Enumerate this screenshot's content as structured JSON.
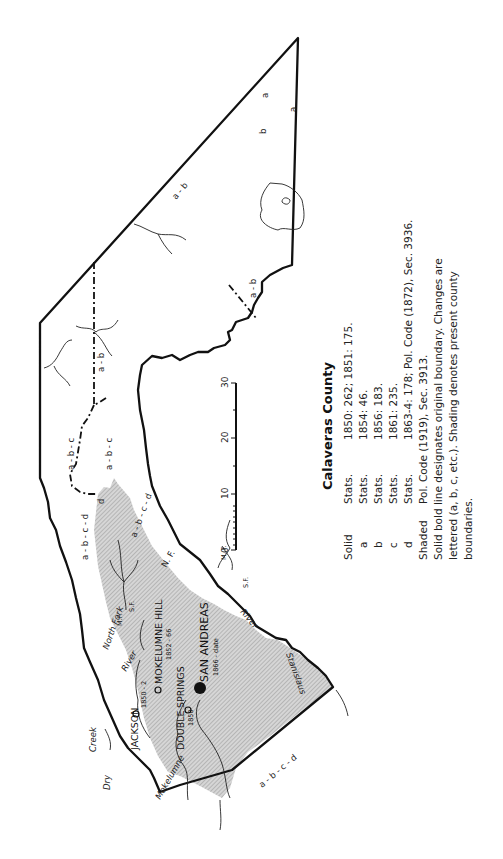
{
  "map": {
    "title": "Calaveras County",
    "colors": {
      "line": "#111111",
      "shade": "#c8c8c8",
      "background": "#ffffff"
    },
    "legend": [
      {
        "key": "Solid",
        "source": "Stats.",
        "text": "1850: 262; 1851: 175."
      },
      {
        "key": "a",
        "source": "Stats.",
        "text": "1854: 46."
      },
      {
        "key": "b",
        "source": "Stats.",
        "text": "1856: 183."
      },
      {
        "key": "c",
        "source": "Stats.",
        "text": "1861: 235."
      },
      {
        "key": "d",
        "source": "Stats.",
        "text": "1863-4: 178; Pol. Code (1872), Sec. 3936."
      },
      {
        "key": "Shaded",
        "source": "Pol. Code (1919), Sec. 3913.",
        "text": ""
      }
    ],
    "notes": [
      "Solid bold line designates original boundary. Changes are",
      "lettered (a, b, c, etc.). Shading denotes present county",
      "boundaries."
    ],
    "scale": {
      "ticks": [
        "0",
        "10",
        "20",
        "30"
      ]
    },
    "places": {
      "san_andreas": "SAN ANDREAS",
      "san_andreas_dates": "1866 - date",
      "mokelumne_hill": "MOKELUMNE HILL",
      "mokelumne_hill_dates": "1852 - 66",
      "double_springs_1": "DOUBLE",
      "double_springs_2": "SPRINGS",
      "double_springs_dates": "1850",
      "jackson": "JACKSON",
      "jackson_dates": "1850 - 2"
    },
    "rivers": {
      "dry": "Dry",
      "creek": "Creek",
      "mokelumne": "Mokelumne",
      "north_fork": "North Fork",
      "river_upper": "River",
      "mf": "M.F.",
      "sf_upper": "S.F.",
      "ne": "N. F.",
      "mf2": "M. F.",
      "sf": "S.F.",
      "river_lower": "River",
      "stanislaus": "Stanislaus"
    },
    "boundary_labels": {
      "a1": "a",
      "a2": "a",
      "b1": "b",
      "ab1": "a - b",
      "ab2": "a - b",
      "ab3": "a - b",
      "abc1": "a - b - c",
      "abc2": "a - b - c",
      "abcd1": "a - b - c - d",
      "abcd2": "a - b - c - d",
      "abcd3": "a - b - c - d",
      "d1": "d"
    }
  }
}
